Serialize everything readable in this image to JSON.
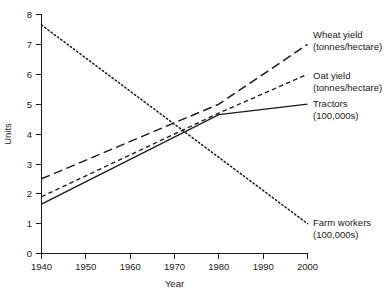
{
  "chart_data": {
    "type": "line",
    "title": "",
    "xlabel": "Year",
    "ylabel": "Units",
    "xlim": [
      1940,
      2000
    ],
    "ylim": [
      0,
      8
    ],
    "grid": false,
    "legend_position": "inline-right",
    "xticks": [
      "1940",
      "1950",
      "1960",
      "1970",
      "1980",
      "1990",
      "2000"
    ],
    "yticks": [
      "0",
      "1",
      "2",
      "3",
      "4",
      "5",
      "6",
      "7",
      "8"
    ],
    "series": [
      {
        "name": "Wheat yield",
        "unit": "(tonnes/hectare)",
        "style": "long-dashed",
        "x": [
          1940,
          1980,
          2000
        ],
        "values": [
          2.5,
          5.0,
          7.0
        ]
      },
      {
        "name": "Oat yield",
        "unit": "(tonnes/hectare)",
        "style": "short-dashed",
        "x": [
          1940,
          1980,
          2000
        ],
        "values": [
          1.9,
          4.7,
          6.0
        ]
      },
      {
        "name": "Tractors",
        "unit": "(100,000s)",
        "style": "solid",
        "x": [
          1940,
          1980,
          2000
        ],
        "values": [
          1.65,
          4.65,
          5.0
        ]
      },
      {
        "name": "Farm workers",
        "unit": "(100,000s)",
        "style": "dotted",
        "x": [
          1940,
          2000
        ],
        "values": [
          7.65,
          1.0
        ]
      }
    ]
  },
  "labels": {
    "wheat_name": "Wheat yield",
    "wheat_unit": "(tonnes/hectare)",
    "oat_name": "Oat yield",
    "oat_unit": "(tonnes/hectare)",
    "tractors_name": "Tractors",
    "tractors_unit": "(100,000s)",
    "farmworkers_name": "Farm workers",
    "farmworkers_unit": "(100,000s)"
  },
  "axes": {
    "y_title": "Units",
    "x_title": "Year",
    "y_0": "0",
    "y_1": "1",
    "y_2": "2",
    "y_3": "3",
    "y_4": "4",
    "y_5": "5",
    "y_6": "6",
    "y_7": "7",
    "y_8": "8",
    "x_1940": "1940",
    "x_1950": "1950",
    "x_1960": "1960",
    "x_1970": "1970",
    "x_1980": "1980",
    "x_1990": "1990",
    "x_2000": "2000"
  }
}
